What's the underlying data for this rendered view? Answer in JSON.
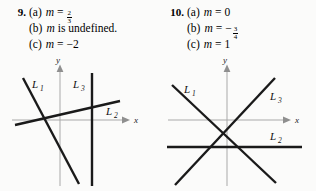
{
  "problems": [
    {
      "number": "9.",
      "answers": [
        {
          "label": "(a)",
          "variable": "m",
          "relation": "=",
          "value": "",
          "fraction": {
            "numerator": "2",
            "denominator": "3"
          },
          "negative": false
        },
        {
          "label": "(b)",
          "variable": "m",
          "relation": "",
          "value": "is undefined.",
          "fraction": null,
          "negative": false
        },
        {
          "label": "(c)",
          "variable": "m",
          "relation": "=",
          "value": "−2",
          "fraction": null,
          "negative": false
        }
      ],
      "graph": {
        "x_axis_label": "x",
        "y_axis_label": "y",
        "lines": [
          {
            "name": "L",
            "subscript": "1",
            "label_text": "L₁",
            "kind": "negative-steep-slope"
          },
          {
            "name": "L",
            "subscript": "2",
            "label_text": "L₂",
            "kind": "shallow-positive-slope"
          },
          {
            "name": "L",
            "subscript": "3",
            "label_text": "L₃",
            "kind": "vertical"
          }
        ]
      }
    },
    {
      "number": "10.",
      "answers": [
        {
          "label": "(a)",
          "variable": "m",
          "relation": "=",
          "value": "0",
          "fraction": null,
          "negative": false
        },
        {
          "label": "(b)",
          "variable": "m",
          "relation": "=",
          "value": "",
          "fraction": {
            "numerator": "3",
            "denominator": "4"
          },
          "negative": true
        },
        {
          "label": "(c)",
          "variable": "m",
          "relation": "=",
          "value": "1",
          "fraction": null,
          "negative": false
        }
      ],
      "graph": {
        "x_axis_label": "x",
        "y_axis_label": "y",
        "lines": [
          {
            "name": "L",
            "subscript": "1",
            "label_text": "L₁",
            "kind": "negative-slope"
          },
          {
            "name": "L",
            "subscript": "2",
            "label_text": "L₂",
            "kind": "horizontal"
          },
          {
            "name": "L",
            "subscript": "3",
            "label_text": "L₃",
            "kind": "positive-slope"
          }
        ]
      }
    }
  ],
  "colors": {
    "background": "#fbfbfa",
    "text": "#000000",
    "data_line": "#1a1a1a",
    "axis_line": "#a9a9a9"
  }
}
